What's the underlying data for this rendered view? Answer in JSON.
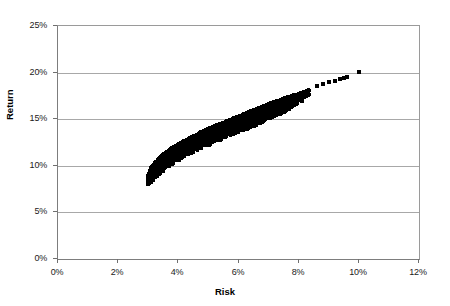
{
  "chart_data": {
    "type": "scatter",
    "title": "",
    "xlabel": "Risk",
    "ylabel": "Return",
    "xlim": [
      0,
      12
    ],
    "ylim": [
      0,
      25
    ],
    "x_unit": "%",
    "y_unit": "%",
    "grid": "horizontal",
    "legend": "none",
    "marker": {
      "shape": "square",
      "color": "#000000",
      "size_px": 3
    },
    "xticks": [
      "0%",
      "2%",
      "4%",
      "6%",
      "8%",
      "10%",
      "12%"
    ],
    "xtick_values": [
      0,
      2,
      4,
      6,
      8,
      10,
      12
    ],
    "yticks": [
      "0%",
      "5%",
      "10%",
      "15%",
      "20%",
      "25%"
    ],
    "ytick_values": [
      0,
      5,
      10,
      15,
      20,
      25
    ],
    "series": [
      {
        "name": "Portfolios",
        "frontier_upper": [
          [
            2.98,
            9.0
          ],
          [
            3.05,
            9.6
          ],
          [
            3.15,
            10.1
          ],
          [
            3.3,
            10.7
          ],
          [
            3.5,
            11.3
          ],
          [
            3.75,
            11.9
          ],
          [
            4.0,
            12.4
          ],
          [
            4.3,
            12.9
          ],
          [
            4.6,
            13.4
          ],
          [
            4.9,
            13.9
          ],
          [
            5.2,
            14.3
          ],
          [
            5.5,
            14.7
          ],
          [
            5.8,
            15.1
          ],
          [
            6.1,
            15.5
          ],
          [
            6.4,
            15.9
          ],
          [
            6.7,
            16.3
          ],
          [
            7.0,
            16.7
          ],
          [
            7.3,
            17.0
          ],
          [
            7.6,
            17.4
          ],
          [
            7.9,
            17.7
          ],
          [
            8.2,
            18.0
          ],
          [
            8.6,
            18.6
          ],
          [
            8.9,
            18.9
          ],
          [
            9.2,
            19.2
          ],
          [
            9.4,
            19.4
          ],
          [
            9.6,
            19.6
          ],
          [
            10.0,
            20.1
          ]
        ],
        "frontier_lower": [
          [
            2.98,
            8.3
          ],
          [
            3.1,
            8.6
          ],
          [
            3.3,
            9.3
          ],
          [
            3.55,
            10.0
          ],
          [
            3.85,
            10.7
          ],
          [
            4.15,
            11.3
          ],
          [
            4.5,
            11.9
          ],
          [
            4.85,
            12.4
          ],
          [
            5.2,
            12.9
          ],
          [
            5.55,
            13.4
          ],
          [
            5.9,
            13.9
          ],
          [
            6.25,
            14.3
          ],
          [
            6.6,
            14.8
          ],
          [
            6.95,
            15.3
          ],
          [
            7.3,
            15.8
          ],
          [
            7.6,
            16.3
          ],
          [
            7.9,
            16.9
          ],
          [
            8.15,
            17.4
          ]
        ],
        "tail_points": [
          [
            8.15,
            18.0
          ],
          [
            8.3,
            18.1
          ],
          [
            8.6,
            18.6
          ],
          [
            8.8,
            18.8
          ],
          [
            9.0,
            19.0
          ],
          [
            9.2,
            19.2
          ],
          [
            9.35,
            19.4
          ],
          [
            9.5,
            19.5
          ],
          [
            9.6,
            19.6
          ],
          [
            10.0,
            20.1
          ]
        ],
        "n_points_approx": 2000,
        "x_range": [
          2.98,
          10.0
        ],
        "y_range": [
          8.3,
          20.1
        ]
      }
    ],
    "colors": {
      "marker": "#000000",
      "gridline": "#a8a8a8",
      "axis": "#7d7d7d",
      "background": "#ffffff",
      "text": "#000000"
    }
  },
  "axes": {
    "x_title": "Risk",
    "y_title": "Return"
  }
}
